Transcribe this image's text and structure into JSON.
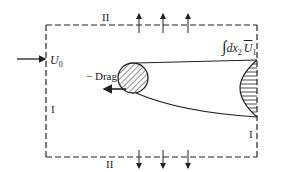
{
  "diagram": {
    "type": "control-volume momentum diagram",
    "labels": {
      "top_surface": "II",
      "bottom_surface": "II",
      "left_surface": "I",
      "right_surface": "I",
      "freestream_velocity": "U",
      "freestream_velocity_sub": "0",
      "drag": "− Drag",
      "integral_symbol": "∫",
      "integral_expr": "dx",
      "integral_expr_sub": "2",
      "integral_velocity": "U",
      "integral_velocity_sub": "1"
    },
    "colors": {
      "line": "#222222",
      "background": "#ffffff"
    },
    "elements": {
      "control_volume": {
        "style": "dashed rectangle",
        "x0": 46,
        "y0": 25,
        "x1": 257,
        "y1": 157
      },
      "body": {
        "shape": "circle",
        "cx": 133,
        "cy": 78,
        "r": 15,
        "fill": "hatched"
      },
      "outflow_arrows_top": 3,
      "outflow_arrows_bottom": 3,
      "wake_profile": "horizontal-hatched velocity deficit at right surface"
    }
  }
}
